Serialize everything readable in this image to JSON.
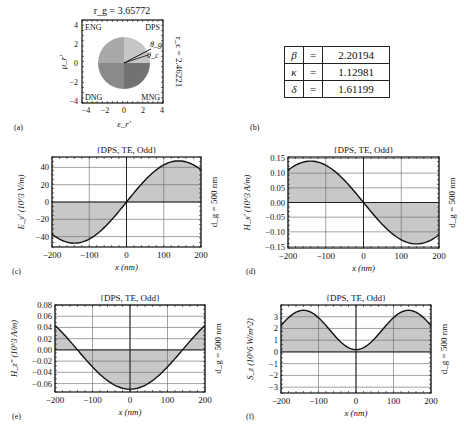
{
  "figure": {
    "panels": [
      {
        "id": "a",
        "label": "(a)"
      },
      {
        "id": "b",
        "label": "(b)"
      },
      {
        "id": "c",
        "label": "(c)"
      },
      {
        "id": "d",
        "label": "(d)"
      },
      {
        "id": "e",
        "label": "(e)"
      },
      {
        "id": "f",
        "label": "(f)"
      }
    ]
  },
  "panel_a": {
    "top_label": "r_g = 3.65772",
    "right_label": "r_c = 2.46221",
    "xlabel": "ε_r'",
    "ylabel": "μ_r'",
    "quadrants": {
      "top_left": "ENG",
      "top_right": "DPS",
      "bottom_left": "DNG",
      "bottom_right": "MNG"
    },
    "arrows": [
      "θ_g",
      "θ_c"
    ],
    "xticks": [
      "−4",
      "−2",
      "0",
      "2",
      "4"
    ],
    "yticks": [
      "4",
      "2",
      "0",
      "−2",
      "−4"
    ],
    "colors": {
      "top_left": "#a9a9a9",
      "top_right": "#c6c6c6",
      "bottom_left": "#8a8a8a",
      "bottom_right": "#727272"
    }
  },
  "panel_b": {
    "rows": [
      {
        "symbol": "β",
        "eq": "=",
        "value": "2.20194"
      },
      {
        "symbol": "κ",
        "eq": "=",
        "value": "1.12981"
      },
      {
        "symbol": "δ",
        "eq": "=",
        "value": "1.61199"
      }
    ]
  },
  "chart_data": [
    {
      "panel": "c",
      "type": "line",
      "title": "{DPS, TE, Odd}",
      "xlabel": "x (nm)",
      "ylabel": "E_y' (10^3 V/m)",
      "right_label": "d_g = 500 nm",
      "xlim": [
        -200,
        200
      ],
      "ylim": [
        -52,
        52
      ],
      "xticks": [
        -200,
        -100,
        0,
        100,
        200
      ],
      "yticks": [
        -40,
        -20,
        0,
        20,
        40
      ],
      "grid": true,
      "fill_to_zero": true,
      "x": [
        -200,
        -150,
        -140,
        -100,
        -50,
        0,
        50,
        100,
        140,
        150,
        200
      ],
      "y": [
        -38,
        -47,
        -47.5,
        -42,
        -24,
        0,
        24,
        42,
        47.5,
        47,
        38
      ]
    },
    {
      "panel": "d",
      "type": "line",
      "title": "{DPS, TE, Odd}",
      "xlabel": "x (nm)",
      "ylabel": "H_x' (10^3 A/m)",
      "right_label": "d_g = 500 nm",
      "xlim": [
        -200,
        200
      ],
      "ylim": [
        -0.155,
        0.155
      ],
      "xticks": [
        -200,
        -100,
        0,
        100,
        200
      ],
      "yticks": [
        -0.15,
        -0.1,
        -0.05,
        0.0,
        0.05,
        0.1,
        0.15
      ],
      "grid": true,
      "fill_to_zero": true,
      "x": [
        -200,
        -150,
        -140,
        -100,
        -50,
        0,
        50,
        100,
        140,
        150,
        200
      ],
      "y": [
        0.112,
        0.139,
        0.141,
        0.125,
        0.072,
        0,
        -0.072,
        -0.125,
        -0.141,
        -0.139,
        -0.112
      ]
    },
    {
      "panel": "e",
      "type": "line",
      "title": "{DPS, TE, Odd}",
      "xlabel": "x (nm)",
      "ylabel": "H_z'' (10^3 A/m)",
      "right_label": "d_g = 500 nm",
      "xlim": [
        -200,
        200
      ],
      "ylim": [
        -0.075,
        0.08
      ],
      "xticks": [
        -200,
        -100,
        0,
        100,
        200
      ],
      "yticks": [
        -0.06,
        -0.04,
        -0.02,
        0.0,
        0.02,
        0.04,
        0.06,
        0.08
      ],
      "grid": true,
      "fill_to_zero": true,
      "x": [
        -200,
        -150,
        -140,
        -100,
        -50,
        0,
        50,
        100,
        140,
        150,
        200
      ],
      "y": [
        0.046,
        0.006,
        0,
        -0.024,
        -0.058,
        -0.07,
        -0.058,
        -0.024,
        0,
        0.006,
        0.046
      ]
    },
    {
      "panel": "f",
      "type": "line",
      "title": "{DPS, TE, Odd}",
      "xlabel": "x (nm)",
      "ylabel": "S_z (10^6 W/m^2)",
      "right_label": "d_g = 500 nm",
      "xlim": [
        -200,
        200
      ],
      "ylim": [
        -3.5,
        4
      ],
      "xticks": [
        -200,
        -100,
        0,
        100,
        200
      ],
      "yticks": [
        -3,
        -2,
        -1,
        0,
        1,
        2,
        3
      ],
      "grid": true,
      "fill_to_zero": true,
      "x": [
        -200,
        -150,
        -140,
        -100,
        -50,
        0,
        50,
        100,
        140,
        150,
        200
      ],
      "y": [
        2.2,
        3.5,
        3.55,
        3.0,
        1.3,
        0.2,
        1.3,
        3.0,
        3.55,
        3.5,
        2.2
      ]
    }
  ]
}
